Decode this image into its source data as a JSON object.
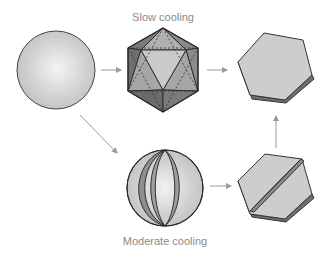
{
  "labels": {
    "top": "Slow cooling",
    "bottom": "Moderate cooling"
  },
  "colors": {
    "arrow": "#9a9a9a",
    "outline": "#3a3a3a",
    "face_light": "#cfcfcf",
    "face_mid": "#a8a8a8",
    "face_dark": "#7c7c7c",
    "text": "#8a8a8a"
  },
  "nodes": [
    {
      "id": "sphere",
      "shape": "sphere"
    },
    {
      "id": "icosahedron",
      "shape": "icosahedron",
      "caption": "Slow cooling"
    },
    {
      "id": "hexagon-plate",
      "shape": "hexagonal plate"
    },
    {
      "id": "banded-sphere",
      "shape": "sphere with lens-shaped bands",
      "caption": "Moderate cooling"
    },
    {
      "id": "twinned-hexagon",
      "shape": "hexagonal plate with diagonal ridge"
    }
  ],
  "edges": [
    {
      "from": "sphere",
      "to": "icosahedron"
    },
    {
      "from": "icosahedron",
      "to": "hexagon-plate"
    },
    {
      "from": "sphere",
      "to": "banded-sphere"
    },
    {
      "from": "banded-sphere",
      "to": "twinned-hexagon"
    },
    {
      "from": "twinned-hexagon",
      "to": "hexagon-plate"
    }
  ]
}
